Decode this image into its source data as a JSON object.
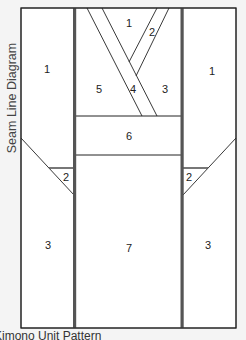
{
  "side_title": "Seam Line Diagram",
  "caption": "Kimono Unit Pattern",
  "colors": {
    "background": "#f4f4f4",
    "piece_fill": "#ffffff",
    "thin_line": "#222222",
    "seam_line": "#555555"
  },
  "pieces": {
    "left_panel": {
      "top": "1",
      "triangle": "2",
      "bottom": "3"
    },
    "center_panel": {
      "v_top": "1",
      "v_strip_right": "2",
      "right": "3",
      "v_strip_left": "4",
      "left": "5",
      "band": "6",
      "bottom": "7"
    },
    "right_panel": {
      "top": "1",
      "triangle": "2",
      "bottom": "3"
    }
  }
}
